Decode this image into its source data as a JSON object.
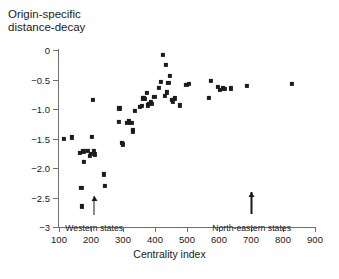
{
  "chart_data": {
    "type": "scatter",
    "title": "Origin-specific\ndistance-decay",
    "xlabel": "Centrality index",
    "ylabel": "",
    "xlim": [
      100,
      900
    ],
    "ylim": [
      -3,
      0
    ],
    "grid": false,
    "legend": null,
    "xticks": [
      100,
      200,
      300,
      400,
      500,
      600,
      700,
      800,
      900
    ],
    "xtick_labels": [
      "100",
      "200",
      "300",
      "400",
      "500",
      "600",
      "700",
      "800",
      "900"
    ],
    "yticks": [
      0,
      -0.5,
      -1.0,
      -1.5,
      -2.0,
      -2.5,
      -3
    ],
    "ytick_labels": [
      "0",
      "−0.5",
      "−1.0",
      "−1.5",
      "−2.0",
      "−2.5",
      "−3"
    ],
    "marker": "square",
    "marker_color": "#1c1c1c",
    "points": [
      [
        116,
        -1.51
      ],
      [
        140,
        -1.48
      ],
      [
        166,
        -1.75
      ],
      [
        170,
        -2.34
      ],
      [
        172,
        -2.65
      ],
      [
        176,
        -1.72
      ],
      [
        178,
        -1.9
      ],
      [
        190,
        -1.71
      ],
      [
        196,
        -1.79
      ],
      [
        200,
        -1.76
      ],
      [
        203,
        -1.47
      ],
      [
        207,
        -0.84
      ],
      [
        210,
        -1.72
      ],
      [
        213,
        -1.77
      ],
      [
        240,
        -2.11
      ],
      [
        243,
        -2.31
      ],
      [
        286,
        -1.22
      ],
      [
        289,
        -0.99
      ],
      [
        296,
        -1.57
      ],
      [
        300,
        -1.6
      ],
      [
        314,
        -1.23
      ],
      [
        319,
        -1.21
      ],
      [
        326,
        -1.24
      ],
      [
        330,
        -1.38
      ],
      [
        332,
        -1.36
      ],
      [
        338,
        -1.03
      ],
      [
        352,
        -0.96
      ],
      [
        358,
        -0.95
      ],
      [
        362,
        -0.82
      ],
      [
        366,
        -0.81
      ],
      [
        369,
        -0.83
      ],
      [
        374,
        -0.73
      ],
      [
        378,
        -0.94
      ],
      [
        382,
        -0.92
      ],
      [
        386,
        -0.88
      ],
      [
        390,
        -0.91
      ],
      [
        398,
        -0.8
      ],
      [
        412,
        -0.64
      ],
      [
        418,
        -0.54
      ],
      [
        424,
        -0.09
      ],
      [
        430,
        -0.78
      ],
      [
        434,
        -0.25
      ],
      [
        438,
        -0.72
      ],
      [
        442,
        -0.56
      ],
      [
        446,
        -0.44
      ],
      [
        452,
        -0.85
      ],
      [
        456,
        -0.87
      ],
      [
        462,
        -0.82
      ],
      [
        478,
        -0.94
      ],
      [
        498,
        -0.59
      ],
      [
        506,
        -0.57
      ],
      [
        568,
        -0.81
      ],
      [
        574,
        -0.52
      ],
      [
        596,
        -0.63
      ],
      [
        604,
        -0.67
      ],
      [
        612,
        -0.65
      ],
      [
        618,
        -0.66
      ],
      [
        638,
        -0.65
      ],
      [
        688,
        -0.61
      ],
      [
        828,
        -0.57
      ]
    ],
    "annotations": [
      {
        "text": "Western states",
        "x": 210,
        "label_y": -2.94,
        "arrow_tip_y": -2.48,
        "arrow_base_y": -2.8
      },
      {
        "text": "North-eastern states",
        "x": 702,
        "label_y": -2.94,
        "arrow_tip_y": -2.4,
        "arrow_base_y": -2.78
      }
    ]
  }
}
